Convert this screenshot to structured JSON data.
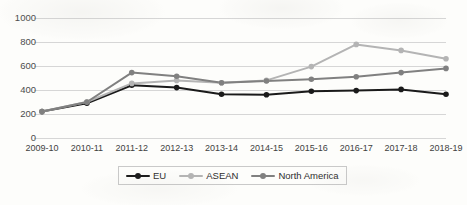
{
  "chart_data": {
    "type": "line",
    "title": "",
    "xlabel": "",
    "ylabel": "",
    "categories": [
      "2009-10",
      "2010-11",
      "2011-12",
      "2012-13",
      "2013-14",
      "2014-15",
      "2015-16",
      "2016-17",
      "2017-18",
      "2018-19"
    ],
    "ylim": [
      0,
      1000
    ],
    "yticks": [
      0,
      200,
      400,
      600,
      800,
      1000
    ],
    "ytick_labels": [
      "0",
      "200",
      "400",
      "600",
      "800",
      "1000"
    ],
    "grid": "horizontal",
    "legend_position": "bottom",
    "series": [
      {
        "name": "EU",
        "color": "#1a1a1a",
        "marker": "circle",
        "values": [
          220,
          290,
          440,
          420,
          365,
          360,
          390,
          395,
          405,
          365
        ]
      },
      {
        "name": "ASEAN",
        "color": "#b4b4b4",
        "marker": "circle",
        "values": [
          220,
          300,
          455,
          480,
          460,
          480,
          595,
          780,
          730,
          660
        ]
      },
      {
        "name": "North America",
        "color": "#808080",
        "marker": "circle",
        "values": [
          220,
          300,
          545,
          515,
          460,
          475,
          490,
          510,
          545,
          580
        ]
      }
    ]
  },
  "legend": {
    "items": [
      {
        "label": "EU",
        "color": "#1a1a1a"
      },
      {
        "label": "ASEAN",
        "color": "#b4b4b4"
      },
      {
        "label": "North America",
        "color": "#808080"
      }
    ]
  },
  "colors": {
    "gridline": "#d6d6d6",
    "axis_text": "#3f3f3f",
    "legend_border": "#c9c9c9",
    "background": "#fdfdfb"
  }
}
